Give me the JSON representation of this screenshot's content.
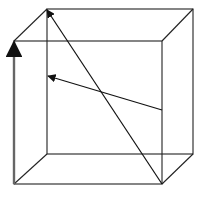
{
  "diagram": {
    "type": "cube-wireframe-with-vectors",
    "colors": {
      "background": "#ffffff",
      "edge": "#222222",
      "vertical_vector": "#666666",
      "arrow": "#111111"
    },
    "back_face": {
      "tl": [
        47,
        9
      ],
      "tr": [
        193,
        9
      ],
      "br": [
        193,
        154
      ],
      "bl": [
        47,
        154
      ]
    },
    "front_face": {
      "tl": [
        14,
        41
      ],
      "tr": [
        162,
        41
      ],
      "br": [
        162,
        184
      ],
      "bl": [
        14,
        184
      ]
    },
    "vectors": [
      {
        "name": "space-diagonal",
        "from": [
          162,
          184
        ],
        "to": [
          47,
          9
        ]
      },
      {
        "name": "face-vector",
        "from": [
          162,
          110
        ],
        "to": [
          47,
          76
        ]
      },
      {
        "name": "vertical-edge-vector",
        "from": [
          14,
          184
        ],
        "to": [
          14,
          41
        ]
      }
    ]
  }
}
